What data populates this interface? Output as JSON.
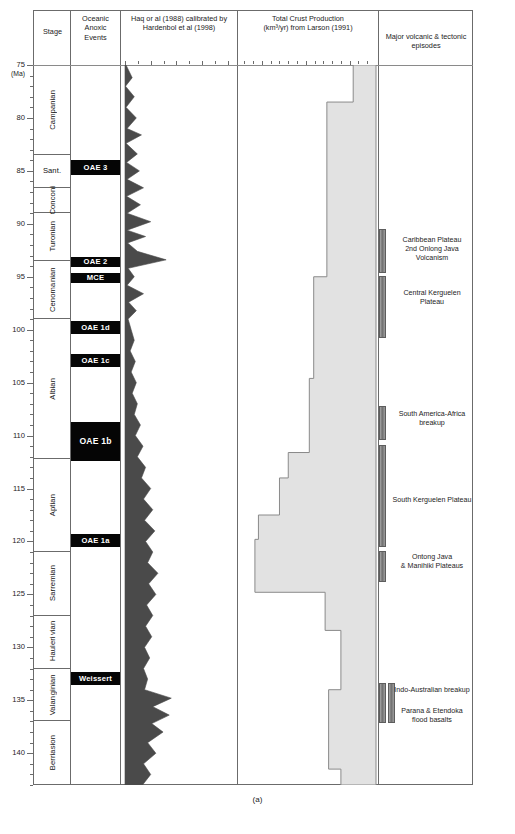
{
  "caption": "(a)",
  "axis": {
    "unit_label": "(Ma)",
    "major_ticks": [
      75,
      80,
      85,
      90,
      95,
      100,
      105,
      110,
      115,
      120,
      125,
      130,
      135,
      140
    ],
    "range": [
      75,
      143
    ]
  },
  "columns": {
    "stage": {
      "title": "Stage"
    },
    "oae": {
      "title": "Oceanic\nAnoxic\nEvents",
      "line1": "Oceanic",
      "line2": "Anoxic",
      "line3": "Events"
    },
    "sealevel": {
      "line1": "Haq or al (1988) calibrated by",
      "line2": "Hardenbol et al (1998)",
      "ticks": [
        "250 m",
        "200",
        "150",
        "100",
        "50"
      ]
    },
    "crust": {
      "line1": "Total Crust Production",
      "line2": "(km³/yr) from Larson (1991)",
      "ticks": [
        "30",
        "25",
        "20"
      ]
    },
    "volcanic": {
      "line1": "Major volcanic & tectonic",
      "line2": "episodes"
    }
  },
  "stages": [
    {
      "name": "Campanian",
      "top": 75,
      "bottom": 83.5,
      "rotated": true
    },
    {
      "name": "Sant.",
      "top": 83.5,
      "bottom": 86.6,
      "rotated": false
    },
    {
      "name": "Conconi",
      "top": 86.6,
      "bottom": 89.0,
      "rotated": true
    },
    {
      "name": "Turonian",
      "top": 89.0,
      "bottom": 93.5,
      "rotated": true
    },
    {
      "name": "Cenoma nian",
      "top": 93.5,
      "bottom": 99.0,
      "rotated": true,
      "two_line": true
    },
    {
      "name": "Albian",
      "top": 99.0,
      "bottom": 112.2,
      "rotated": true
    },
    {
      "name": "Aptian",
      "top": 112.2,
      "bottom": 121.0,
      "rotated": true
    },
    {
      "name": "Sarremian",
      "top": 121.0,
      "bottom": 127.0,
      "rotated": true
    },
    {
      "name": "Hauleri vian",
      "top": 127.0,
      "bottom": 132.0,
      "rotated": true,
      "two_line": true
    },
    {
      "name": "Valan ginian",
      "top": 132.0,
      "bottom": 137.0,
      "rotated": true,
      "two_line": true
    },
    {
      "name": "Berriasion",
      "top": 137.0,
      "bottom": 143.0,
      "rotated": true
    }
  ],
  "oae_events": [
    {
      "label": "OAE 3",
      "top": 84.0,
      "bottom": 85.4,
      "big": false
    },
    {
      "label": "OAE 2",
      "top": 93.1,
      "bottom": 94.1,
      "big": false
    },
    {
      "label": "MCE",
      "top": 94.6,
      "bottom": 95.6,
      "big": false
    },
    {
      "label": "OAE 1d",
      "top": 99.2,
      "bottom": 100.4,
      "big": false
    },
    {
      "label": "OAE 1c",
      "top": 102.3,
      "bottom": 103.5,
      "big": false
    },
    {
      "label": "OAE 1b",
      "top": 108.7,
      "bottom": 112.4,
      "big": true
    },
    {
      "label": "OAE 1a",
      "top": 119.3,
      "bottom": 120.5,
      "big": false
    },
    {
      "label": "Weissert",
      "top": 132.3,
      "bottom": 133.6,
      "big": false
    }
  ],
  "volcanic_events": [
    {
      "label": "Caribbean Plateau\n2nd Onlong Java Volcanism",
      "line1": "Caribbean Plateau",
      "line2": "2nd Onlong Java Volcanism",
      "bar_top": 90.5,
      "bar_bottom": 94.6,
      "label_y": 91.6
    },
    {
      "label": "Central Kerguelen Plateau",
      "line1": "Central Kerguelen Plateau",
      "line2": "",
      "bar_top": 94.9,
      "bar_bottom": 100.8,
      "label_y": 96.6
    },
    {
      "label": "South America-Africa\nbreakup",
      "line1": "South America-Africa",
      "line2": "breakup",
      "bar_top": 107.2,
      "bar_bottom": 110.4,
      "label_y": 108.1
    },
    {
      "label": "South Kerguelen Plateau",
      "line1": "South Kerguelen Plateau",
      "line2": "",
      "bar_top": 110.9,
      "bar_bottom": 120.5,
      "label_y": 116.2
    },
    {
      "label": "Ontong Java\n& Manihiki Plateaus",
      "line1": "Ontong Java",
      "line2": "& Manihiki Plateaus",
      "bar_top": 120.9,
      "bar_bottom": 123.8,
      "label_y": 121.6
    },
    {
      "label": "Indo-Australian breakup",
      "line1": "Indo-Australian breakup",
      "line2": "",
      "bar_top": 133.4,
      "bar_bottom": 137.1,
      "label_y": 134.1,
      "double_bar": true
    },
    {
      "label": "Parana & Etendoka\nflood basalts",
      "line1": "Parana & Etendoka",
      "line2": "flood basalts",
      "bar_top": 133.4,
      "bar_bottom": 137.1,
      "label_y": 136.1,
      "no_bar": true
    }
  ],
  "chart_data": {
    "type": "line",
    "ylabel": "Age (Ma)",
    "ylim": [
      143,
      75
    ],
    "panels": [
      {
        "name": "sea_level",
        "type": "area",
        "title": "Haq or al (1988) calibrated by Hardenbol et al (1998)",
        "xlabel": "Sea level (m)",
        "xlim": [
          250,
          40
        ],
        "xticks": [
          250,
          200,
          150,
          100,
          50
        ],
        "x": [
          75,
          76.2,
          77.0,
          78.0,
          79.0,
          80.0,
          81.0,
          81.6,
          82.4,
          83.4,
          84.2,
          85.0,
          85.8,
          86.6,
          87.4,
          88.2,
          89.0,
          89.8,
          90.6,
          91.2,
          91.8,
          92.6,
          93.4,
          94.2,
          95.0,
          95.8,
          96.6,
          97.4,
          98.2,
          99.0,
          100.0,
          101.0,
          102.0,
          103.0,
          104.0,
          105.0,
          106.0,
          107.0,
          108.0,
          109.0,
          110.0,
          111.0,
          112.0,
          113.0,
          114.0,
          115.0,
          116.0,
          117.0,
          118.0,
          119.0,
          120.0,
          121.0,
          122.0,
          123.0,
          124.0,
          125.0,
          126.0,
          127.0,
          128.0,
          129.0,
          130.0,
          131.0,
          132.0,
          133.0,
          134.0,
          134.8,
          135.6,
          136.4,
          137.2,
          138.0,
          139.0,
          140.0,
          141.0,
          142.0,
          143.0
        ],
        "y": [
          248,
          236,
          249,
          232,
          248,
          228,
          246,
          218,
          248,
          226,
          247,
          222,
          246,
          214,
          247,
          220,
          246,
          200,
          246,
          210,
          245,
          226,
          170,
          244,
          232,
          246,
          214,
          243,
          228,
          244,
          238,
          232,
          240,
          230,
          238,
          228,
          236,
          226,
          232,
          220,
          230,
          215,
          226,
          210,
          218,
          200,
          214,
          196,
          212,
          192,
          210,
          196,
          206,
          186,
          204,
          190,
          208,
          196,
          210,
          198,
          212,
          202,
          214,
          206,
          212,
          160,
          196,
          164,
          198,
          176,
          206,
          190,
          214,
          200,
          216
        ],
        "fill": "#4a4a4a",
        "note": "Eustatic sea-level curve, sawtooth third-order cycles; highest stands (largest excursions to the right) near 92.6 Ma and 134.8 Ma"
      },
      {
        "name": "crust_production",
        "type": "step",
        "title": "Total Crust Production (km³/yr) from Larson (1991)",
        "xlabel": "Crust production (km³/yr)",
        "xlim": [
          32.5,
          17.0
        ],
        "xticks": [
          30,
          25,
          20
        ],
        "steps": [
          {
            "from": 75.0,
            "to": 78.5,
            "value": 19.6
          },
          {
            "from": 78.5,
            "to": 95.0,
            "value": 22.6
          },
          {
            "from": 95.0,
            "to": 104.6,
            "value": 24.1
          },
          {
            "from": 104.6,
            "to": 111.6,
            "value": 24.6
          },
          {
            "from": 111.6,
            "to": 114.0,
            "value": 27.0
          },
          {
            "from": 114.0,
            "to": 117.5,
            "value": 28.0
          },
          {
            "from": 117.5,
            "to": 119.8,
            "value": 30.4
          },
          {
            "from": 119.8,
            "to": 124.8,
            "value": 30.8
          },
          {
            "from": 124.8,
            "to": 128.4,
            "value": 22.8
          },
          {
            "from": 128.4,
            "to": 134.0,
            "value": 21.0
          },
          {
            "from": 134.0,
            "to": 141.5,
            "value": 22.4
          },
          {
            "from": 141.5,
            "to": 143.0,
            "value": 21.0
          }
        ],
        "fill": "#e2e2e2",
        "note": "Step histogram of global ocean crust production; peak ~30.8 km³/yr in the Aptian (120-125 Ma)"
      }
    ]
  }
}
